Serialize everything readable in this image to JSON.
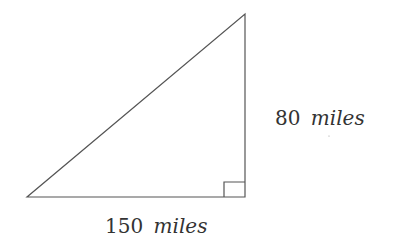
{
  "diagram": {
    "type": "right-triangle",
    "right_angle_marker": true,
    "line_color": "#555555",
    "text_color": "#333333",
    "sides": {
      "vertical": {
        "value": "80",
        "unit": "miles"
      },
      "horizontal": {
        "value": "150",
        "unit": "miles"
      }
    }
  }
}
